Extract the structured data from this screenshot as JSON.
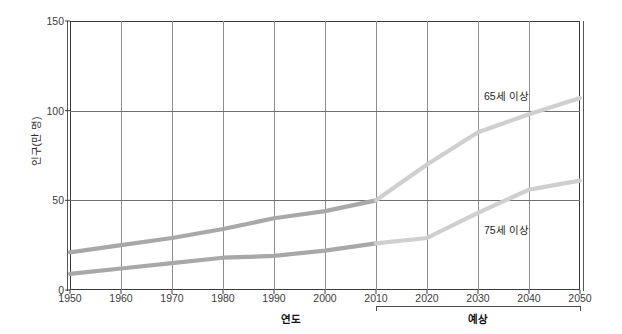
{
  "chart_data": {
    "type": "line",
    "title": "",
    "xlabel": "연도",
    "ylabel": "인구(만 명)",
    "x": [
      1950,
      1960,
      1970,
      1980,
      1990,
      2000,
      2010,
      2020,
      2030,
      2040,
      2050
    ],
    "xticklabels": [
      "1950",
      "1960",
      "1970",
      "1980",
      "1990",
      "2000",
      "2010",
      "2020",
      "2030",
      "2040",
      "2050"
    ],
    "yticklabels": [
      "0",
      "50",
      "100",
      "150"
    ],
    "yticks": [
      0,
      50,
      100,
      150
    ],
    "ylim": [
      0,
      150
    ],
    "xlim": [
      1950,
      2050
    ],
    "grid": true,
    "legend_position": "inline-annotation",
    "forecast_label": "예상",
    "forecast_start": 2010,
    "series": [
      {
        "name": "65세 이상",
        "color": "#a8a8a8",
        "forecast_color": "#cfcfcf",
        "values": [
          21,
          25,
          29,
          34,
          40,
          44,
          50,
          70,
          88,
          98,
          107
        ]
      },
      {
        "name": "75세 이상",
        "color": "#a8a8a8",
        "forecast_color": "#cfcfcf",
        "values": [
          9,
          12,
          15,
          18,
          19,
          22,
          26,
          29,
          43,
          56,
          61
        ]
      }
    ],
    "annotations": [
      {
        "text": "65세 이상",
        "x": 2038,
        "y": 100
      },
      {
        "text": "75세 이상",
        "x": 2038,
        "y": 37
      }
    ],
    "axis_color": "#3a3a3a",
    "gridline_color": "#8e8e8e",
    "background": "#ffffff"
  }
}
